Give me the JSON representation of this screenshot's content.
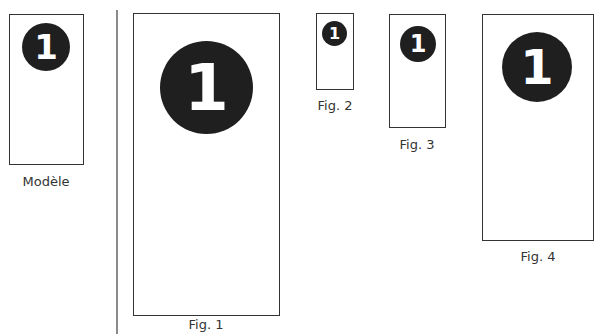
{
  "figures": [
    {
      "id": "modele",
      "label": "Modèle",
      "badge": "1"
    },
    {
      "id": "fig1",
      "label": "Fig. 1",
      "badge": "1"
    },
    {
      "id": "fig2",
      "label": "Fig. 2",
      "badge": "1"
    },
    {
      "id": "fig3",
      "label": "Fig. 3",
      "badge": "1"
    },
    {
      "id": "fig4",
      "label": "Fig. 4",
      "badge": "1"
    }
  ],
  "colors": {
    "badge": "#1f1f1f",
    "border": "#333333",
    "divider": "#8a8a8a"
  }
}
